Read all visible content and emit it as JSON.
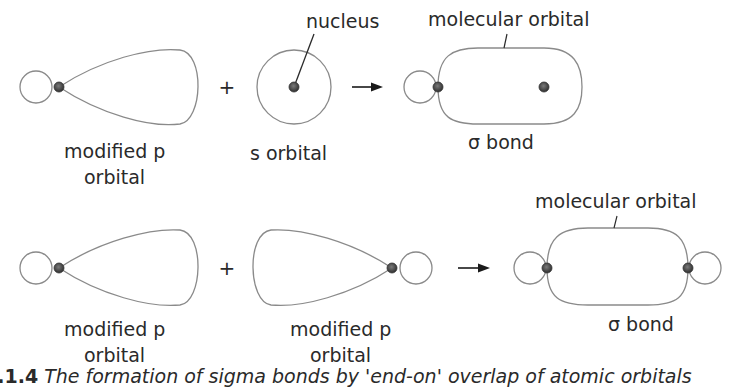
{
  "diagram": {
    "colors": {
      "outline": "#8a8a8a",
      "nucleus_fill": "#4a4a4a",
      "text": "#2a2a2a",
      "background": "#ffffff"
    },
    "row1": {
      "orbital_a_label_line1": "modified p",
      "orbital_a_label_line2": "orbital",
      "operator": "+",
      "orbital_b_label": "s orbital",
      "nucleus_label": "nucleus",
      "result_label": "molecular orbital",
      "bond_label": "σ bond"
    },
    "row2": {
      "orbital_a_label_line1": "modified p",
      "orbital_a_label_line2": "orbital",
      "operator": "+",
      "orbital_b_label_line1": "modified p",
      "orbital_b_label_line2": "orbital",
      "result_label": "molecular orbital",
      "bond_label": "σ bond"
    },
    "caption": {
      "number": "2.1.4",
      "text": "The formation of sigma bonds by 'end-on' overlap of atomic orbitals"
    }
  }
}
